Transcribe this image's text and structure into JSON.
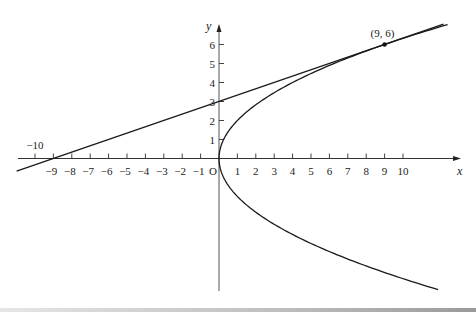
{
  "figure": {
    "colors": {
      "background": "#ffffff",
      "curve": "#1a1a1a",
      "axis": "#333333",
      "text": "#222222"
    },
    "axes": {
      "x_label": "x",
      "y_label": "y",
      "origin_label": "O",
      "x_ticks": [
        -10,
        -9,
        -8,
        -7,
        -6,
        -5,
        -4,
        -3,
        -2,
        -1,
        1,
        2,
        3,
        4,
        5,
        6,
        7,
        8,
        9,
        10
      ],
      "x_tick_labels": [
        "−10",
        "−9",
        "−8",
        "−7",
        "−6",
        "−5",
        "−4",
        "−3",
        "−2",
        "−1",
        "1",
        "2",
        "3",
        "4",
        "5",
        "6",
        "7",
        "8",
        "9",
        "10"
      ],
      "y_ticks": [
        1,
        2,
        3,
        4,
        5,
        6
      ],
      "y_tick_labels": [
        "1",
        "2",
        "3",
        "4",
        "5",
        "6"
      ],
      "x_range": [
        -11,
        13.2
      ],
      "y_range": [
        -7,
        7.2
      ]
    },
    "curves": [
      {
        "name": "parabola",
        "equation": "y^2 = 4x",
        "y_from": -6.9,
        "y_to": 7.05
      },
      {
        "name": "tangent-line",
        "equation": "y = (x + 9) / 3",
        "x_from": -11,
        "x_to": 12.2
      }
    ],
    "points": [
      {
        "name": "tangent-point",
        "x": 9,
        "y": 6,
        "label": "(9, 6)"
      }
    ]
  },
  "layout": {
    "origin_px": [
      219,
      158.5
    ],
    "unit_x_px": 18.4,
    "unit_y_px": 19,
    "x_axis_px": [
      18,
      461
    ],
    "y_axis_px": [
      24,
      291
    ]
  }
}
